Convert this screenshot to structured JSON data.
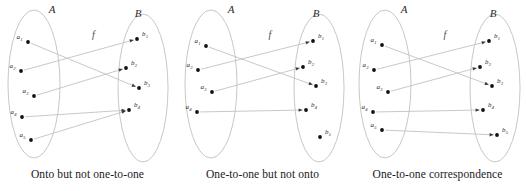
{
  "figure": {
    "width": 526,
    "height": 191,
    "background": "#ffffff",
    "line_color": "#c2c2c2",
    "ellipse_color": "#b9b9b9",
    "dot_color": "#111111",
    "text_color": "#1a1a1a"
  },
  "panels": [
    {
      "id": "onto-not-one-to-one",
      "caption": "Onto but not one-to-one",
      "map_label": "f",
      "domain": {
        "name": "A",
        "label_x": 52,
        "label_y": 13,
        "ellipse": {
          "cx": 34,
          "cy": 84,
          "rx": 26,
          "ry": 74
        },
        "elements": [
          {
            "label": "a",
            "sub": "1",
            "x": 28,
            "y": 42
          },
          {
            "label": "a",
            "sub": "2",
            "x": 21,
            "y": 71
          },
          {
            "label": "a",
            "sub": "3",
            "x": 34,
            "y": 96
          },
          {
            "label": "a",
            "sub": "4",
            "x": 22,
            "y": 117
          },
          {
            "label": "a",
            "sub": "5",
            "x": 31,
            "y": 140
          }
        ]
      },
      "codomain": {
        "name": "B",
        "label_x": 138,
        "label_y": 17,
        "ellipse": {
          "cx": 143,
          "cy": 88,
          "rx": 25,
          "ry": 74
        },
        "elements": [
          {
            "label": "b",
            "sub": "1",
            "x": 137,
            "y": 39
          },
          {
            "label": "b",
            "sub": "2",
            "x": 126,
            "y": 68
          },
          {
            "label": "b",
            "sub": "3",
            "x": 139,
            "y": 88
          },
          {
            "label": "b",
            "sub": "4",
            "x": 129,
            "y": 110
          }
        ]
      },
      "arrows": [
        {
          "from": 0,
          "to": 2
        },
        {
          "from": 1,
          "to": 0
        },
        {
          "from": 2,
          "to": 1
        },
        {
          "from": 3,
          "to": 3
        },
        {
          "from": 4,
          "to": 3
        }
      ]
    },
    {
      "id": "one-to-one-not-onto",
      "caption": "One-to-one but not onto",
      "map_label": "f",
      "domain": {
        "name": "A",
        "label_x": 56,
        "label_y": 13,
        "ellipse": {
          "cx": 36,
          "cy": 84,
          "rx": 26,
          "ry": 74
        },
        "elements": [
          {
            "label": "a",
            "sub": "1",
            "x": 31,
            "y": 46
          },
          {
            "label": "a",
            "sub": "2",
            "x": 23,
            "y": 70
          },
          {
            "label": "a",
            "sub": "3",
            "x": 37,
            "y": 92
          },
          {
            "label": "a",
            "sub": "4",
            "x": 22,
            "y": 112
          }
        ]
      },
      "codomain": {
        "name": "B",
        "label_x": 141,
        "label_y": 17,
        "ellipse": {
          "cx": 144,
          "cy": 88,
          "rx": 25,
          "ry": 74
        },
        "elements": [
          {
            "label": "b",
            "sub": "1",
            "x": 138,
            "y": 41
          },
          {
            "label": "b",
            "sub": "2",
            "x": 128,
            "y": 67
          },
          {
            "label": "b",
            "sub": "3",
            "x": 141,
            "y": 86
          },
          {
            "label": "b",
            "sub": "4",
            "x": 131,
            "y": 110
          },
          {
            "label": "b",
            "sub": "5",
            "x": 145,
            "y": 137
          }
        ]
      },
      "arrows": [
        {
          "from": 0,
          "to": 2
        },
        {
          "from": 1,
          "to": 0
        },
        {
          "from": 2,
          "to": 1
        },
        {
          "from": 3,
          "to": 3
        }
      ]
    },
    {
      "id": "one-to-one-correspondence",
      "caption": "One-to-one correspondence",
      "map_label": "f",
      "domain": {
        "name": "A",
        "label_x": 54,
        "label_y": 13,
        "ellipse": {
          "cx": 35,
          "cy": 84,
          "rx": 26,
          "ry": 74
        },
        "elements": [
          {
            "label": "a",
            "sub": "1",
            "x": 32,
            "y": 45
          },
          {
            "label": "a",
            "sub": "2",
            "x": 24,
            "y": 70
          },
          {
            "label": "a",
            "sub": "3",
            "x": 38,
            "y": 92
          },
          {
            "label": "a",
            "sub": "4",
            "x": 23,
            "y": 112
          },
          {
            "label": "a",
            "sub": "5",
            "x": 32,
            "y": 130
          }
        ]
      },
      "codomain": {
        "name": "B",
        "label_x": 143,
        "label_y": 17,
        "ellipse": {
          "cx": 145,
          "cy": 88,
          "rx": 25,
          "ry": 74
        },
        "elements": [
          {
            "label": "b",
            "sub": "1",
            "x": 139,
            "y": 41
          },
          {
            "label": "b",
            "sub": "2",
            "x": 130,
            "y": 67
          },
          {
            "label": "b",
            "sub": "3",
            "x": 142,
            "y": 86
          },
          {
            "label": "b",
            "sub": "4",
            "x": 133,
            "y": 110
          },
          {
            "label": "b",
            "sub": "5",
            "x": 147,
            "y": 135
          }
        ]
      },
      "arrows": [
        {
          "from": 0,
          "to": 2
        },
        {
          "from": 1,
          "to": 0
        },
        {
          "from": 2,
          "to": 1
        },
        {
          "from": 3,
          "to": 3
        },
        {
          "from": 4,
          "to": 4
        }
      ]
    }
  ]
}
